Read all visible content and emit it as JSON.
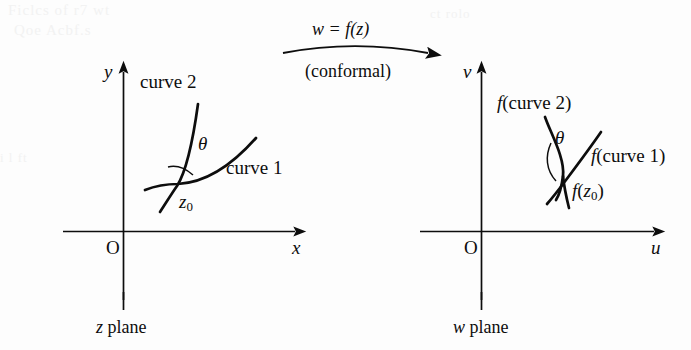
{
  "figure": {
    "kind": "conformal-mapping-diagram",
    "background_color": "#fdfdfd",
    "ink_color": "#0d0d0d"
  },
  "mapping": {
    "label": "w = f(z)",
    "label_w": "w",
    "label_eq": "=",
    "label_fz": "f(z)",
    "sublabel": "(conformal)",
    "arrow_icon": "right-arrow-icon"
  },
  "left_plane": {
    "caption": "z plane",
    "x_axis_label": "x",
    "y_axis_label": "y",
    "origin_label": "O",
    "curve1_label": "curve 1",
    "curve2_label": "curve 2",
    "angle_label": "θ",
    "point_label_base": "z",
    "point_label_sub": "0"
  },
  "right_plane": {
    "caption": "w plane",
    "x_axis_label": "u",
    "y_axis_label": "v",
    "origin_label": "O",
    "curve1_label_f": "f",
    "curve1_label_arg": "(curve 1)",
    "curve2_label_f": "f",
    "curve2_label_arg": "(curve 2)",
    "angle_label": "θ",
    "point_label_f": "f",
    "point_label_open": "(",
    "point_label_base": "z",
    "point_label_sub": "0",
    "point_label_close": ")"
  },
  "bleed_artifacts": {
    "line1": "Ficlcs of r7 wt",
    "line2": "Qoe Acbf.s",
    "line3": "i  l ft",
    "line4": "ct  rolo"
  }
}
